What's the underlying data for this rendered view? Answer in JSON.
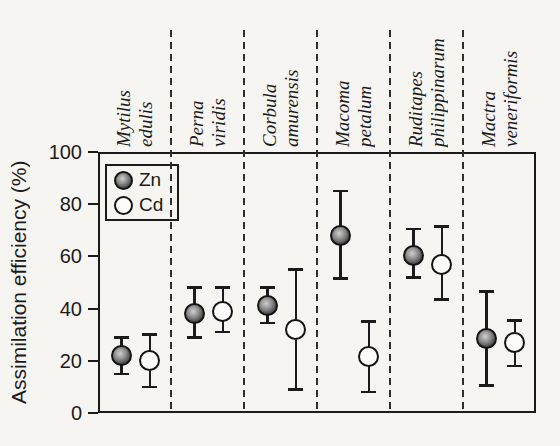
{
  "colors": {
    "paper": "#f6f5f2",
    "ink": "#1b1b1b",
    "open_marker_fill": "#fcfcfa"
  },
  "chart_data": {
    "type": "scatter",
    "title": "",
    "xlabel": "",
    "ylabel": "Assimilation efficiency (%)",
    "ylim": [
      0,
      100
    ],
    "yticks": [
      0,
      20,
      40,
      60,
      80,
      100
    ],
    "grid": false,
    "panel_separators": "vertical-dashed",
    "legend": {
      "position": "top-left-inside",
      "entries": [
        "Zn",
        "Cd"
      ]
    },
    "categories": [
      "Mytilus edulis",
      "Perna viridis",
      "Corbula amurensis",
      "Macoma petalum",
      "Ruditapes philippinarum",
      "Mactra veneriformis"
    ],
    "series": [
      {
        "name": "Zn",
        "marker": "shaded-sphere",
        "values": [
          22,
          38,
          41,
          68,
          60.5,
          28.5
        ],
        "error_low": [
          15,
          29,
          34.5,
          51.5,
          52,
          10.5
        ],
        "error_high": [
          29,
          48,
          48,
          85,
          70.5,
          46.5
        ]
      },
      {
        "name": "Cd",
        "marker": "open-circle",
        "values": [
          20,
          39,
          32,
          21.5,
          57,
          27
        ],
        "error_low": [
          10,
          31,
          9,
          8,
          43.5,
          18
        ],
        "error_high": [
          30,
          48,
          55,
          35,
          71.5,
          35.5
        ]
      }
    ]
  }
}
